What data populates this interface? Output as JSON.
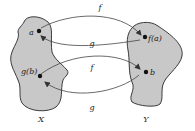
{
  "diagram": {
    "sets": [
      {
        "id": "X",
        "label": "X"
      },
      {
        "id": "Y",
        "label": "Y"
      }
    ],
    "points": [
      {
        "id": "a",
        "label": "a",
        "set": "X"
      },
      {
        "id": "gb",
        "label": "g(b)",
        "set": "X"
      },
      {
        "id": "fa",
        "label": "f(a)",
        "set": "Y"
      },
      {
        "id": "b",
        "label": "b",
        "set": "Y"
      }
    ],
    "arrows": [
      {
        "from": "a",
        "to": "fa",
        "label": "f"
      },
      {
        "from": "fa",
        "to": "a",
        "label": "g"
      },
      {
        "from": "gb",
        "to": "b",
        "label": "f"
      },
      {
        "from": "b",
        "to": "gb",
        "label": "g"
      }
    ],
    "colors": {
      "blob_fill": "#c8c8c8",
      "blob_stroke": "#3a3a3a",
      "line": "#444444",
      "point": "#111111"
    }
  }
}
